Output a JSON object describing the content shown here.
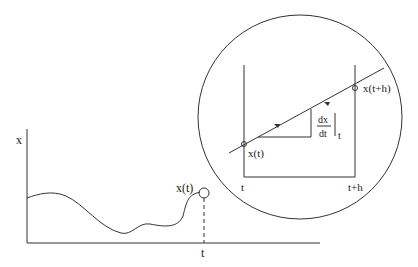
{
  "labels": {
    "axis_x": "x",
    "point_xt": "x(t)",
    "tick_t": "t",
    "zoom_xt": "x(t)",
    "zoom_xth": "x(t+h)",
    "zoom_t": "t",
    "zoom_th": "t+h",
    "deriv_num": "dx",
    "deriv_den": "dt",
    "deriv_eval": "t"
  },
  "colors": {
    "stroke": "#333333",
    "background": "#ffffff"
  }
}
